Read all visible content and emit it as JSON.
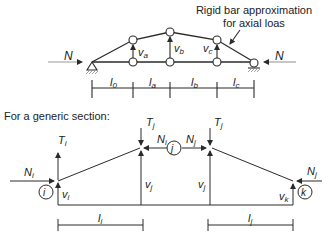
{
  "annotation": {
    "line1": "Rigid bar approximation",
    "line2": "for axial loas"
  },
  "top_diagram": {
    "load_left": "N",
    "load_right": "N",
    "vertical_labels": [
      "v_a",
      "v_b",
      "v_c"
    ],
    "vertical_base": [
      "v",
      "v",
      "v"
    ],
    "vertical_sub": [
      "a",
      "b",
      "c"
    ],
    "span_base": [
      "l",
      "l",
      "l",
      "l"
    ],
    "span_sub": [
      "0",
      "a",
      "b",
      "c"
    ]
  },
  "section_heading": "For a generic section:",
  "bottom_diagram": {
    "nodes": [
      "i",
      "j",
      "k"
    ],
    "T_i": {
      "base": "T",
      "sub": "i"
    },
    "T_j_left": {
      "base": "T",
      "sub": "j"
    },
    "T_j_right": {
      "base": "T",
      "sub": "j"
    },
    "N_i_left": {
      "base": "N",
      "sub": "i"
    },
    "N_i_mid": {
      "base": "N",
      "sub": "i"
    },
    "N_j_mid": {
      "base": "N",
      "sub": "j"
    },
    "N_j_right": {
      "base": "N",
      "sub": "j"
    },
    "v_i": {
      "base": "v",
      "sub": "i"
    },
    "v_j_left": {
      "base": "v",
      "sub": "j"
    },
    "v_j_right": {
      "base": "v",
      "sub": "j"
    },
    "v_k": {
      "base": "v",
      "sub": "k"
    },
    "l_i": {
      "base": "l",
      "sub": "i"
    },
    "l_j": {
      "base": "l",
      "sub": "j"
    }
  },
  "colors": {
    "line": "#2a2a2a",
    "text": "#1a1a1a",
    "hatch": "#888888"
  }
}
